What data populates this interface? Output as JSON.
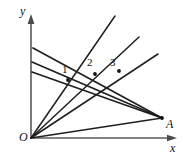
{
  "figure": {
    "type": "geometry-diagram",
    "background_color": "#ffffff",
    "line_color": "#1f1f1f",
    "axis_color": "#5a5a5a",
    "axes": {
      "x_label": "x",
      "y_label": "y",
      "origin_label": "O",
      "origin": {
        "x": 31,
        "y": 138
      },
      "x_end": {
        "x": 176,
        "y": 138
      },
      "y_end": {
        "x": 31,
        "y": 16
      }
    },
    "points": [
      {
        "name": "O",
        "label": "O",
        "x": 31,
        "y": 138
      },
      {
        "name": "A",
        "label": "A",
        "x": 162,
        "y": 118
      },
      {
        "name": "P1",
        "label": "1",
        "x": 68,
        "y": 80
      },
      {
        "name": "P2",
        "label": "2",
        "x": 95,
        "y": 74
      },
      {
        "name": "P3",
        "label": "3",
        "x": 119,
        "y": 71
      }
    ],
    "rays_from_origin": [
      {
        "name": "ray-1",
        "from": "O",
        "to": {
          "x": 115,
          "y": 16
        }
      },
      {
        "name": "ray-2",
        "from": "O",
        "to": {
          "x": 139,
          "y": 37
        }
      },
      {
        "name": "ray-3",
        "from": "O",
        "to": {
          "x": 158,
          "y": 54
        }
      },
      {
        "name": "ray-to-A",
        "from": "O",
        "to": {
          "x": 162,
          "y": 118
        }
      }
    ],
    "transversals": [
      {
        "name": "transversal-1",
        "start": {
          "x": 32,
          "y": 72
        },
        "end": {
          "x": 162,
          "y": 118
        }
      },
      {
        "name": "transversal-2",
        "start": {
          "x": 32,
          "y": 62
        },
        "end": {
          "x": 162,
          "y": 118
        }
      },
      {
        "name": "transversal-3",
        "start": {
          "x": 33,
          "y": 48
        },
        "end": {
          "x": 162,
          "y": 118
        }
      }
    ],
    "labels": {
      "y_axis": "y",
      "x_axis": "x",
      "origin": "O",
      "point_a": "A",
      "index_1": "1",
      "index_2": "2",
      "index_3": "3"
    }
  }
}
